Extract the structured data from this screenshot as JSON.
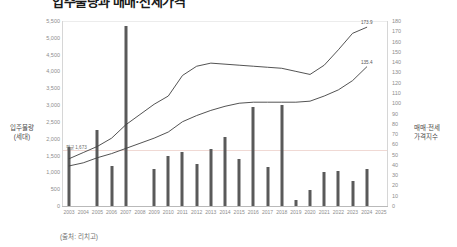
{
  "title": "입주물량과 매매·전세가격",
  "source_note": "(출처: 리치고)",
  "axes": {
    "left": {
      "label": "입주물량\n(세대)",
      "label_line1": "입주물량",
      "label_line2": "(세대)",
      "min": 0,
      "max": 5500,
      "step": 500,
      "ticks": [
        "0",
        "500",
        "1,000",
        "1,500",
        "2,000",
        "2,500",
        "3,000",
        "3,500",
        "4,000",
        "4,500",
        "5,000",
        "5,500"
      ]
    },
    "right": {
      "label_line1": "매매·전세",
      "label_line2": "가격지수",
      "min": 0,
      "max": 180,
      "step": 10,
      "ticks": [
        "0",
        "10",
        "20",
        "30",
        "40",
        "50",
        "60",
        "70",
        "80",
        "90",
        "100",
        "110",
        "120",
        "130",
        "140",
        "150",
        "160",
        "170",
        "180"
      ]
    },
    "x": {
      "ticks": [
        "2003",
        "2004",
        "2005",
        "2006",
        "2007",
        "2008",
        "2009",
        "2010",
        "2011",
        "2012",
        "2013",
        "2014",
        "2015",
        "2016",
        "2017",
        "2018",
        "2019",
        "2020",
        "2021",
        "2022",
        "2023",
        "2024",
        "2025"
      ]
    }
  },
  "annotations": {
    "average_label": "평균 1,673",
    "average_value": 1673,
    "sale_end_label": "173.9",
    "jeonse_end_label": "135.4"
  },
  "chart_data": {
    "type": "bar",
    "title": "입주물량과 매매·전세가격",
    "xlabel": "",
    "ylabel": "입주물량 (세대)",
    "ylabel_secondary": "매매·전세 가격지수",
    "ylim": [
      0,
      5500
    ],
    "ylim_secondary": [
      0,
      180
    ],
    "grid": false,
    "legend_position": "none",
    "categories": [
      "2003",
      "2004",
      "2005",
      "2006",
      "2007",
      "2008",
      "2009",
      "2010",
      "2011",
      "2012",
      "2013",
      "2014",
      "2015",
      "2016",
      "2017",
      "2018",
      "2019",
      "2020",
      "2021",
      "2022",
      "2023",
      "2024",
      "2025"
    ],
    "series": [
      {
        "name": "입주물량(세대)",
        "type": "bar",
        "axis": "left",
        "values": [
          1750,
          0,
          2250,
          1200,
          5350,
          0,
          1100,
          1500,
          1600,
          1250,
          1700,
          2050,
          1400,
          2950,
          1150,
          3000,
          180,
          480,
          1000,
          1050,
          750,
          1100,
          0
        ]
      },
      {
        "name": "매매가격지수",
        "type": "line",
        "axis": "right",
        "values": [
          46,
          52,
          58,
          66,
          79,
          89,
          99,
          107,
          127,
          136,
          139,
          138,
          137,
          136,
          135,
          134,
          131,
          128,
          137,
          152,
          168,
          173.9,
          null
        ]
      },
      {
        "name": "전세가격지수",
        "type": "line",
        "axis": "right",
        "values": [
          39,
          42,
          47,
          51,
          56,
          61,
          66,
          72,
          82,
          88,
          93,
          97,
          100,
          101,
          101,
          101,
          101,
          102,
          107,
          113,
          122,
          135.4,
          null
        ]
      }
    ]
  }
}
